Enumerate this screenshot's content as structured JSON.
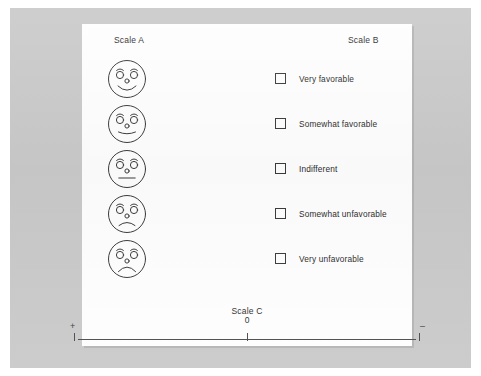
{
  "page": {
    "background_color": "#c9c9c9",
    "sheet_color": "#fefefe",
    "ink_color": "#2d2d2d"
  },
  "headings": {
    "scale_a": "Scale A",
    "scale_b": "Scale B",
    "scale_c": "Scale C"
  },
  "scale_a": {
    "faces": [
      {
        "name": "face-very-favorable",
        "expression": "broad-smile"
      },
      {
        "name": "face-somewhat-favorable",
        "expression": "slight-smile"
      },
      {
        "name": "face-indifferent",
        "expression": "neutral"
      },
      {
        "name": "face-somewhat-unfavorable",
        "expression": "slight-frown"
      },
      {
        "name": "face-very-unfavorable",
        "expression": "deep-frown"
      }
    ]
  },
  "scale_b": {
    "options": [
      {
        "label": "Very favorable",
        "checked": false
      },
      {
        "label": "Somewhat favorable",
        "checked": false
      },
      {
        "label": "Indifferent",
        "checked": false
      },
      {
        "label": "Somewhat unfavorable",
        "checked": false
      },
      {
        "label": "Very unfavorable",
        "checked": false
      }
    ]
  },
  "scale_c": {
    "left_sign": "+",
    "right_sign": "–",
    "center_label": "0"
  }
}
